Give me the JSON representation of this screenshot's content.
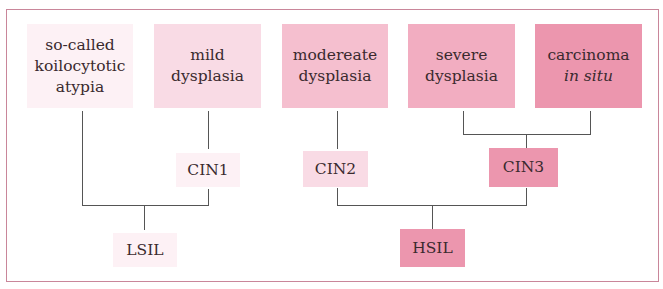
{
  "diagram": {
    "title": "",
    "top_row": [
      {
        "id": "koilocytotic",
        "lines": [
          "so-called",
          "koilocytotic",
          "atypia"
        ],
        "color": "#fdf1f5"
      },
      {
        "id": "mild",
        "lines": [
          "mild",
          "dysplasia"
        ],
        "color": "#f9dbe5"
      },
      {
        "id": "moderate",
        "lines": [
          "modereate",
          "dysplasia"
        ],
        "color": "#f5bfcf"
      },
      {
        "id": "severe",
        "lines": [
          "severe",
          "dysplasia"
        ],
        "color": "#f2adc1"
      },
      {
        "id": "cis",
        "lines": [
          "carcinoma",
          "in situ"
        ],
        "italic_line": 1,
        "color": "#ec96ae"
      }
    ],
    "middle_row": [
      {
        "id": "cin1",
        "label": "CIN1",
        "color": "#fdf1f5"
      },
      {
        "id": "cin2",
        "label": "CIN2",
        "color": "#f9dbe5"
      },
      {
        "id": "cin3",
        "label": "CIN3",
        "color": "#ec96ae"
      }
    ],
    "bottom_row": [
      {
        "id": "lsil",
        "label": "LSIL",
        "color": "#fdf1f5"
      },
      {
        "id": "hsil",
        "label": "HSIL",
        "color": "#ec96ae"
      }
    ],
    "edges": [
      {
        "from": "mild",
        "to": "cin1"
      },
      {
        "from": "moderate",
        "to": "cin2"
      },
      {
        "from": "severe",
        "to": "cin3"
      },
      {
        "from": "cis",
        "to": "cin3"
      },
      {
        "from": "koilocytotic",
        "to": "lsil"
      },
      {
        "from": "cin1",
        "to": "lsil"
      },
      {
        "from": "cin2",
        "to": "hsil"
      },
      {
        "from": "cin3",
        "to": "hsil"
      }
    ],
    "border_color": "#c9869a"
  }
}
